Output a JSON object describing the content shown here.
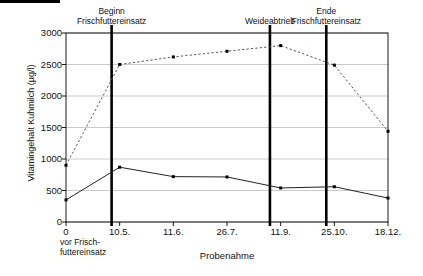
{
  "chart_data": {
    "type": "line",
    "title": "",
    "xlabel": "Probenahme",
    "ylabel": "Vitamingehalt Kuhmilch (µg/l)",
    "grid": true,
    "legend": "none",
    "ylim": [
      0,
      3000
    ],
    "ytick_labels": [
      "0",
      "500",
      "1000",
      "1500",
      "2000",
      "2500",
      "3000"
    ],
    "ytick_values": [
      0,
      500,
      1000,
      1500,
      2000,
      2500,
      3000
    ],
    "categories": [
      "0",
      "10.5.",
      "11.6.",
      "26.7.",
      "11.9.",
      "25.10.",
      "18.12."
    ],
    "xtick_sublabel": "vor Frisch-\nfuttereinsatz",
    "xtick_sublabel_line1": "vor Frisch-",
    "xtick_sublabel_line2": "futtereinsatz",
    "series": [
      {
        "name": "dashed-series",
        "style": "dashed",
        "color": "#555555",
        "values": [
          900,
          2500,
          2620,
          2710,
          2800,
          2490,
          1440
        ]
      },
      {
        "name": "solid-series",
        "style": "solid",
        "color": "#222222",
        "values": [
          350,
          870,
          720,
          715,
          540,
          560,
          380
        ]
      }
    ],
    "annotations": [
      {
        "id": "beginn",
        "x_index": 0.85,
        "line1": "Beginn",
        "line2": "Frischfuttereinsatz"
      },
      {
        "id": "weideabtrieb",
        "x_index": 3.8,
        "line1": "",
        "line2": "Weideabtrieb"
      },
      {
        "id": "ende",
        "x_index": 4.85,
        "line1": "Ende",
        "line2": "Frischfuttereinsatz"
      }
    ],
    "vertical_markers": [
      0.85,
      3.8,
      4.85
    ],
    "colors": {
      "axis": "#000000",
      "grid": "#bdbdbd",
      "marker": "#000000",
      "event_line": "#000000"
    }
  }
}
